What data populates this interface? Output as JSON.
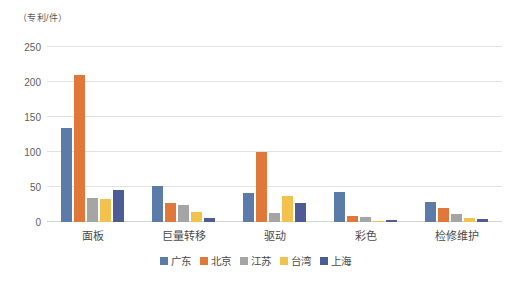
{
  "chart_data": {
    "type": "bar",
    "title": "",
    "subtitle": "",
    "xlabel": "",
    "ylabel": "（专利/件）",
    "ylim": [
      0,
      250
    ],
    "yticks": [
      0,
      50,
      100,
      150,
      200,
      250
    ],
    "grid": true,
    "legend_position": "bottom",
    "categories": [
      "面板",
      "巨量转移",
      "驱动",
      "彩色",
      "检修维护"
    ],
    "series": [
      {
        "name": "广东",
        "color": "#5B7BA8",
        "values": [
          135,
          51,
          42,
          43,
          28
        ]
      },
      {
        "name": "北京",
        "color": "#E0783A",
        "values": [
          210,
          27,
          100,
          9,
          20
        ]
      },
      {
        "name": "江苏",
        "color": "#A5A5A5",
        "values": [
          34,
          25,
          13,
          7,
          11
        ]
      },
      {
        "name": "台湾",
        "color": "#F2C14E",
        "values": [
          33,
          14,
          37,
          1,
          6
        ]
      },
      {
        "name": "上海",
        "color": "#4D5C94",
        "values": [
          46,
          6,
          27,
          3,
          5
        ]
      }
    ]
  },
  "axis": {
    "unit_caption": "（专利/件）"
  }
}
